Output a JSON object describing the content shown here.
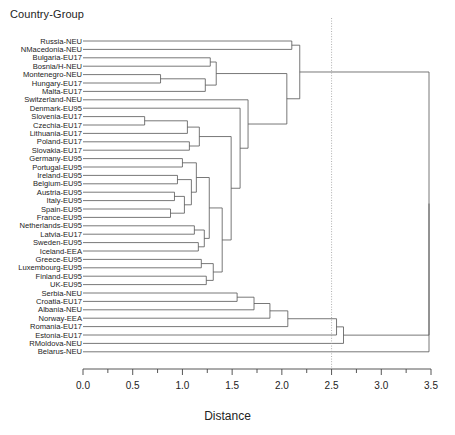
{
  "plot": {
    "title": "Country-Group",
    "axis_title": "Distance"
  },
  "chart_data": {
    "type": "dendrogram",
    "title": "Country-Group",
    "xlabel": "Distance",
    "ylabel": "",
    "xlim": [
      0.0,
      3.5
    ],
    "grid": false,
    "orientation": "horizontal",
    "tick_labels": [
      "0.0",
      "0.5",
      "1.0",
      "1.5",
      "2.0",
      "2.5",
      "3.0",
      "3.5"
    ],
    "tick_values": [
      0.0,
      0.5,
      1.0,
      1.5,
      2.0,
      2.5,
      3.0,
      3.5
    ],
    "minor_tick_values": [
      0.25,
      0.75,
      1.25,
      1.75,
      2.25,
      2.75,
      3.25
    ],
    "cut_line": {
      "value": 2.5,
      "style": "dotted",
      "color": "#9a9a9a"
    },
    "leaves": [
      "Russia-NEU",
      "NMacedonia-NEU",
      "Bulgaria-EU17",
      "Bosnia/H-NEU",
      "Montenegro-NEU",
      "Hungary-EU17",
      "Malta-EU17",
      "Switzerland-NEU",
      "Denmark-EU95",
      "Slovenia-EU17",
      "Czechia-EU17",
      "Lithuania-EU17",
      "Poland-EU17",
      "Slovakia-EU17",
      "Germany-EU95",
      "Portugal-EU95",
      "Ireland-EU95",
      "Belgium-EU95",
      "Austria-EU95",
      "Italy-EU95",
      "Spain-EU95",
      "France-EU95",
      "Netherlands-EU95",
      "Latvia-EU17",
      "Sweden-EU95",
      "Iceland-EEA",
      "Greece-EU95",
      "Luxembourg-EU95",
      "Finland-EU95",
      "UK-EU95",
      "Serbia-NEU",
      "Croatia-EU17",
      "Albania-NEU",
      "Norway-EEA",
      "Romania-EU17",
      "Estonia-EU17",
      "RMoldova-NEU",
      "Belarus-NEU"
    ],
    "merges": [
      {
        "id": "m1",
        "a": "Montenegro-NEU",
        "b": "Hungary-EU17",
        "height": 0.78
      },
      {
        "id": "m2",
        "a": "m1",
        "b": "Malta-EU17",
        "height": 1.23
      },
      {
        "id": "m3",
        "a": "Bulgaria-EU17",
        "b": "Bosnia/H-NEU",
        "height": 1.28
      },
      {
        "id": "m4",
        "a": "m3",
        "b": "m2",
        "height": 1.34
      },
      {
        "id": "m5",
        "a": "Slovenia-EU17",
        "b": "Czechia-EU17",
        "height": 0.62
      },
      {
        "id": "m6",
        "a": "m5",
        "b": "Lithuania-EU17",
        "height": 1.05
      },
      {
        "id": "m7",
        "a": "Poland-EU17",
        "b": "Slovakia-EU17",
        "height": 1.07
      },
      {
        "id": "m8",
        "a": "m6",
        "b": "m7",
        "height": 1.17
      },
      {
        "id": "m9",
        "a": "Germany-EU95",
        "b": "Portugal-EU95",
        "height": 1.0
      },
      {
        "id": "m10",
        "a": "Ireland-EU95",
        "b": "Belgium-EU95",
        "height": 0.95
      },
      {
        "id": "m11",
        "a": "Austria-EU95",
        "b": "Italy-EU95",
        "height": 0.92
      },
      {
        "id": "m12",
        "a": "Spain-EU95",
        "b": "France-EU95",
        "height": 0.88
      },
      {
        "id": "m13",
        "a": "m11",
        "b": "m12",
        "height": 1.02
      },
      {
        "id": "m14",
        "a": "m10",
        "b": "m13",
        "height": 1.09
      },
      {
        "id": "m15",
        "a": "m9",
        "b": "m14",
        "height": 1.14
      },
      {
        "id": "m16",
        "a": "Netherlands-EU95",
        "b": "Latvia-EU17",
        "height": 1.12
      },
      {
        "id": "m17",
        "a": "Sweden-EU95",
        "b": "Iceland-EEA",
        "height": 1.16
      },
      {
        "id": "m18",
        "a": "m16",
        "b": "m17",
        "height": 1.22
      },
      {
        "id": "m19",
        "a": "m15",
        "b": "m18",
        "height": 1.27
      },
      {
        "id": "m20",
        "a": "Greece-EU95",
        "b": "Luxembourg-EU95",
        "height": 1.19
      },
      {
        "id": "m21",
        "a": "Finland-EU95",
        "b": "UK-EU95",
        "height": 1.24
      },
      {
        "id": "m22",
        "a": "m20",
        "b": "m21",
        "height": 1.31
      },
      {
        "id": "m23",
        "a": "m19",
        "b": "m22",
        "height": 1.4
      },
      {
        "id": "m24",
        "a": "m8",
        "b": "m23",
        "height": 1.49
      },
      {
        "id": "m25",
        "a": "Denmark-EU95",
        "b": "m24",
        "height": 1.58
      },
      {
        "id": "m26",
        "a": "Switzerland-NEU",
        "b": "m25",
        "height": 1.66
      },
      {
        "id": "m27",
        "a": "m4",
        "b": "m26",
        "height": 2.05
      },
      {
        "id": "m28",
        "a": "Serbia-NEU",
        "b": "Croatia-EU17",
        "height": 1.55
      },
      {
        "id": "m29",
        "a": "m28",
        "b": "Albania-NEU",
        "height": 1.72
      },
      {
        "id": "m30",
        "a": "m29",
        "b": "Norway-EEA",
        "height": 1.88
      },
      {
        "id": "m31",
        "a": "m30",
        "b": "Romania-EU17",
        "height": 2.06
      },
      {
        "id": "m32",
        "a": "m31",
        "b": "Estonia-EU17",
        "height": 2.55
      },
      {
        "id": "m33",
        "a": "m32",
        "b": "RMoldova-NEU",
        "height": 2.62
      },
      {
        "id": "m34",
        "a": "Russia-NEU",
        "b": "NMacedonia-NEU",
        "height": 2.1
      },
      {
        "id": "m35",
        "a": "m34",
        "b": "m27",
        "height": 2.18
      },
      {
        "id": "m36",
        "a": "m35",
        "b": "m33",
        "height": 3.48
      },
      {
        "id": "m37",
        "a": "m36",
        "b": "Belarus-NEU",
        "height": 3.48
      }
    ],
    "root": "m37"
  }
}
